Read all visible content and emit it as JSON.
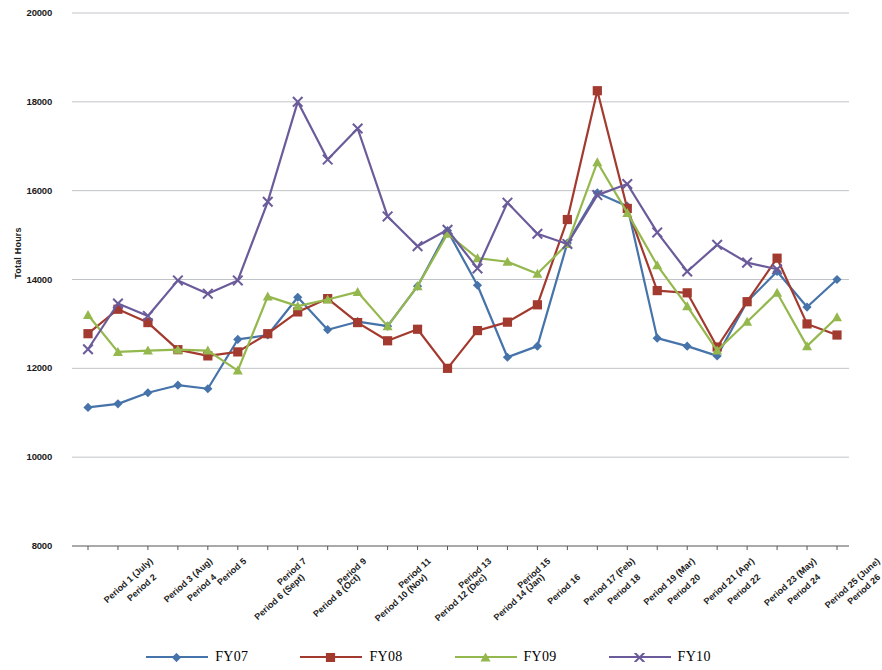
{
  "chart_data": {
    "type": "line",
    "title": "",
    "xlabel": "",
    "ylabel": "Total Hours",
    "ylim": [
      8000,
      20000
    ],
    "ytick_step": 2000,
    "yticks": [
      8000,
      10000,
      12000,
      14000,
      16000,
      18000,
      20000
    ],
    "grid": true,
    "legend_position": "bottom",
    "categories": [
      "Period 1 (July)",
      "Period 2",
      "Period 3 (Aug)",
      "Period 4",
      "Period 5",
      "Period 6 (Sept)",
      "Period 7",
      "Period 8 (Oct)",
      "Period 9",
      "Period 10 (Nov)",
      "Period 11",
      "Period 12 (Dec)",
      "Period 13",
      "Period 14 (Jan)",
      "Period 15",
      "Period 16",
      "Period 17 (Feb)",
      "Period 18",
      "Period 19 (Mar)",
      "Period 20",
      "Period 21 (Apr)",
      "Period 22",
      "Period 23 (May)",
      "Period 24",
      "Period 25 (June)",
      "Period 26"
    ],
    "series": [
      {
        "name": "FY07",
        "color": "#4673a9",
        "marker": "diamond",
        "values": [
          11120,
          11200,
          11450,
          11620,
          11540,
          12650,
          12750,
          13600,
          12870,
          13050,
          12950,
          13850,
          15100,
          13870,
          12250,
          12500,
          14820,
          15950,
          15650,
          12680,
          12500,
          12280,
          13500,
          14180,
          13380,
          14000
        ]
      },
      {
        "name": "FY08",
        "color": "#a33a2f",
        "marker": "square",
        "values": [
          12780,
          13330,
          13030,
          12420,
          12280,
          12370,
          12780,
          13270,
          13570,
          13030,
          12620,
          12880,
          12000,
          12850,
          13040,
          13430,
          15350,
          18250,
          15600,
          13750,
          13700,
          12480,
          13500,
          14480,
          13000,
          12750
        ]
      },
      {
        "name": "FY09",
        "color": "#94b84d",
        "marker": "triangle",
        "values": [
          13200,
          12370,
          12400,
          12420,
          12400,
          11950,
          13620,
          13400,
          13550,
          13720,
          12950,
          13850,
          15030,
          14480,
          14400,
          14130,
          14800,
          16640,
          15500,
          14320,
          13400,
          12400,
          13050,
          13700,
          12500,
          13150
        ]
      },
      {
        "name": "FY10",
        "color": "#6b5b9a",
        "marker": "x",
        "values": [
          12430,
          13460,
          13180,
          13980,
          13680,
          13980,
          15750,
          18000,
          16700,
          17400,
          15420,
          14750,
          15120,
          14250,
          15730,
          15030,
          14800,
          15900,
          16150,
          15060,
          14180,
          14780,
          14380,
          14230,
          null,
          null
        ]
      }
    ]
  },
  "axis": {
    "y_title": "Total Hours",
    "y_tick_labels": [
      "20000",
      "18000",
      "16000",
      "14000",
      "12000",
      "10000",
      "8000"
    ]
  },
  "legend": {
    "items": [
      {
        "label": "FY07",
        "color": "#4673a9"
      },
      {
        "label": "FY08",
        "color": "#a33a2f"
      },
      {
        "label": "FY09",
        "color": "#94b84d"
      },
      {
        "label": "FY10",
        "color": "#6b5b9a"
      }
    ]
  }
}
